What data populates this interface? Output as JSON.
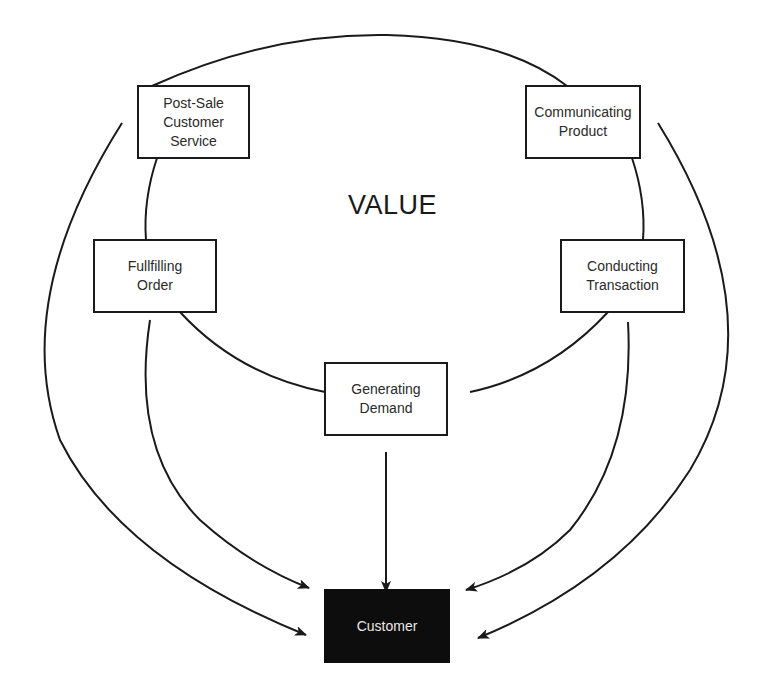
{
  "diagram": {
    "center_label": "VALUE",
    "nodes": [
      {
        "id": "post-sale",
        "lines": [
          "Post-Sale",
          "Customer",
          "Service"
        ]
      },
      {
        "id": "communicating",
        "lines": [
          "Communicating",
          "Product"
        ]
      },
      {
        "id": "fulfilling",
        "lines": [
          "Fullfilling",
          "Order"
        ]
      },
      {
        "id": "conducting",
        "lines": [
          "Conducting",
          "Transaction"
        ]
      },
      {
        "id": "generating",
        "lines": [
          "Generating",
          "Demand"
        ]
      }
    ],
    "target": {
      "label": "Customer"
    },
    "colors": {
      "stroke": "#1a1a1a",
      "target_fill": "#0d0d0d",
      "target_text": "#e8e8e8"
    }
  }
}
